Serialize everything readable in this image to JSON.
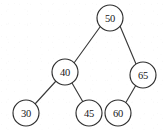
{
  "figure": {
    "type": "binary-search-tree",
    "background_color": "#ffffff",
    "stroke_color": "#2e2e2e",
    "label_color": "#161616"
  },
  "chart_data": {
    "type": "diagram",
    "title": "",
    "nodes": [
      {
        "id": "n50",
        "label": "50",
        "cx": 110,
        "cy": 18,
        "r": 13,
        "level": 0,
        "role": "root"
      },
      {
        "id": "n40",
        "label": "40",
        "cx": 65,
        "cy": 72,
        "r": 13,
        "level": 1,
        "role": "left-child"
      },
      {
        "id": "n65",
        "label": "65",
        "cx": 143,
        "cy": 75,
        "r": 13,
        "level": 1,
        "role": "right-child"
      },
      {
        "id": "n30",
        "label": "30",
        "cx": 26,
        "cy": 113,
        "r": 13,
        "level": 2,
        "role": "leaf"
      },
      {
        "id": "n45",
        "label": "45",
        "cx": 89,
        "cy": 113,
        "r": 13,
        "level": 2,
        "role": "leaf"
      },
      {
        "id": "n60",
        "label": "60",
        "cx": 118,
        "cy": 113,
        "r": 13,
        "level": 2,
        "role": "leaf"
      }
    ],
    "edges": [
      {
        "id": "e50-40",
        "from": "n50",
        "to": "n40",
        "x1": 100,
        "y1": 27,
        "x2": 74,
        "y2": 63
      },
      {
        "id": "e50-65",
        "from": "n50",
        "to": "n65",
        "x1": 120,
        "y1": 26,
        "x2": 136,
        "y2": 64
      },
      {
        "id": "e40-30",
        "from": "n40",
        "to": "n30",
        "x1": 56,
        "y1": 81,
        "x2": 35,
        "y2": 104
      },
      {
        "id": "e40-45",
        "from": "n40",
        "to": "n45",
        "x1": 72,
        "y1": 83,
        "x2": 83,
        "y2": 102
      },
      {
        "id": "e65-60",
        "from": "n65",
        "to": "n60",
        "x1": 136,
        "y1": 85,
        "x2": 125,
        "y2": 104
      }
    ],
    "node_values": [
      50,
      40,
      65,
      30,
      45,
      60
    ],
    "legend": [],
    "xlabel": "",
    "ylabel": ""
  }
}
